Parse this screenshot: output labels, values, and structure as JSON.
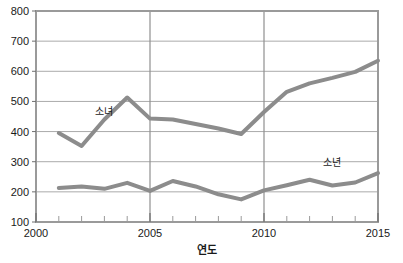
{
  "chart_data": {
    "type": "line",
    "title": "",
    "xlabel": "연도",
    "ylabel": "",
    "xlim": [
      2000,
      2015
    ],
    "ylim": [
      100,
      800
    ],
    "grid": true,
    "legend": "inline-labels",
    "x": [
      2001,
      2002,
      2003,
      2004,
      2005,
      2006,
      2007,
      2008,
      2009,
      2010,
      2011,
      2012,
      2013,
      2014,
      2015
    ],
    "xticks": [
      "2000",
      "2005",
      "2010",
      "2015"
    ],
    "xtick_values": [
      2000,
      2005,
      2010,
      2015
    ],
    "xminor_ticks": [
      2001,
      2002,
      2003,
      2004,
      2006,
      2007,
      2008,
      2009,
      2011,
      2012,
      2013,
      2014
    ],
    "yticks": [
      "100",
      "200",
      "300",
      "400",
      "500",
      "600",
      "700",
      "800"
    ],
    "ytick_values": [
      100,
      200,
      300,
      400,
      500,
      600,
      700,
      800
    ],
    "series": [
      {
        "name": "소녀",
        "color": "#8c8c8c",
        "label_x": 2003,
        "label_y": 455,
        "values": [
          395,
          352,
          440,
          513,
          443,
          440,
          425,
          410,
          392,
          465,
          532,
          560,
          578,
          598,
          635
        ]
      },
      {
        "name": "소년",
        "color": "#8c8c8c",
        "label_x": 2013,
        "label_y": 285,
        "values": [
          213,
          218,
          210,
          230,
          203,
          236,
          218,
          192,
          175,
          205,
          222,
          240,
          221,
          231,
          262
        ]
      }
    ]
  }
}
